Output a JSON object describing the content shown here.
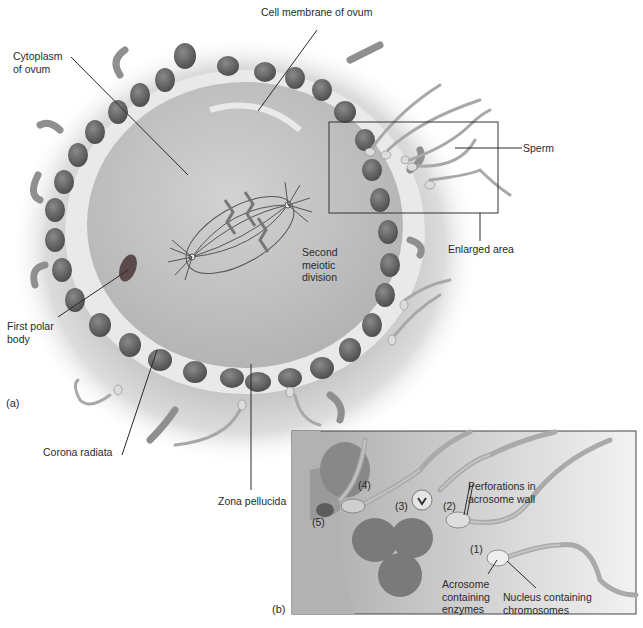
{
  "figure": {
    "panels": [
      {
        "id": "a",
        "tag": "(a)"
      },
      {
        "id": "b",
        "tag": "(b)"
      }
    ],
    "colors": {
      "background": "#ffffff",
      "halo": "#cfcfcf",
      "zona": "#e6e6e6",
      "cytoplasm": "#c4c4c4",
      "cell": "#6e6e6e",
      "cell_dark": "#4a4a4a",
      "sperm": "#b8b8b8",
      "leader": "#2a2a2a",
      "inset_bg": "#bdbdbd"
    }
  },
  "labels_a": {
    "cell_membrane": "Cell membrane of ovum",
    "cytoplasm": "Cytoplasm\nof ovum",
    "sperm": "Sperm",
    "enlarged_area": "Enlarged area",
    "second_meiotic": "Second\nmeiotic\ndivision",
    "first_polar_body": "First polar\nbody",
    "corona_radiata": "Corona radiata",
    "zona_pellucida": "Zona pellucida"
  },
  "labels_b": {
    "step1": "(1)",
    "step2": "(2)",
    "step3": "(3)",
    "step4": "(4)",
    "step5": "(5)",
    "perforations": "Perforations in\nacrosome wall",
    "acrosome": "Acrosome\ncontaining\nenzymes",
    "nucleus": "Nucleus containing\nchromosomes"
  }
}
